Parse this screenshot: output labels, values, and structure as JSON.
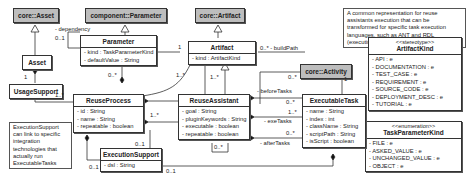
{
  "classes": {
    "core_asset": {
      "name": "core::Asset"
    },
    "component_parameter": {
      "name": "component::Parameter"
    },
    "core_artifact": {
      "name": "core::Artifact"
    },
    "core_activity": {
      "name": "core::Activity"
    },
    "asset": {
      "name": "Asset"
    },
    "usage_support": {
      "name": "UsageSupport"
    },
    "parameter": {
      "name": "Parameter",
      "attrs": [
        "- kind : TaskParameterKind",
        "- defaultValue : String"
      ]
    },
    "artifact": {
      "name": "Artifact",
      "attrs": [
        "- kind : ArtifactKind"
      ]
    },
    "reuse_process": {
      "name": "ReuseProcess",
      "attrs": [
        "- id : String",
        "- name : String",
        "- repeatable : boolean"
      ]
    },
    "reuse_assistant": {
      "name": "ReuseAssistant",
      "attrs": [
        "- goal : String",
        "- pluginKeywords : String",
        "- executable : boolean",
        "- repeatable : boolean"
      ]
    },
    "executable_task": {
      "name": "ExecutableTask",
      "attrs": [
        "- name : String",
        "- index : int",
        "- className : String",
        "- scriptPath : String",
        "- isScript : boolean"
      ]
    },
    "execution_support": {
      "name": "ExecutionSupport",
      "attrs": [
        "- dsl : String"
      ]
    },
    "artifact_kind": {
      "stereotype": "<<stereotype>>",
      "name": "ArtifactKind",
      "attrs": [
        "- API : e",
        "- DOCUMENTATION : e",
        "- TEST_CASE : e",
        "- REQUIREMENT : e",
        "- SOURCE_CODE : e",
        "- DEPLOYMENT_DESC : e",
        "- TUTORIAL : e"
      ]
    },
    "task_parameter_kind": {
      "stereotype": "<<enumeration>>",
      "name": "TaskParameterKind",
      "attrs": [
        "- FILE : e",
        "- ASKED_VALUE : e",
        "- UNCHANGED_VALUE : e",
        "- OBJECT : e"
      ]
    }
  },
  "notes": {
    "top": "A common representation for reuse assistants execution that can be transformed for specific task execution languages, such as ANT and RDL (executing BPMN activities into a BPMS).",
    "left": "ExecutionSupport can link to specific integration technologies that actually run ExecutableTasks"
  },
  "labels": {
    "dependency": "- dependency",
    "dep_mult": "0..1",
    "asset_usage_mult": "1",
    "usage_process_mult": "1..*",
    "param_mult": "0..*",
    "param_artifact_mult": "1",
    "process_artifact_mult": "1..*",
    "assistant_artifact_mult": "1..*",
    "build_path": "0..* - buildPath",
    "activity_mult_left": "0..*",
    "activity_mult_right": "1",
    "process_assistant_mult": "1..*",
    "before_tasks": "- beforeTasks",
    "before_mult": "0..*",
    "exe_tasks": "- exeTasks",
    "exe_mult": "1..*",
    "after_tasks": "- afterTasks",
    "after_mult": "0..*",
    "assistant_self_mult": "0..*",
    "process_exec_mult_top": "0..1",
    "process_exec_mult_bottom": "0..1",
    "task_exec_mult": "0..1"
  }
}
